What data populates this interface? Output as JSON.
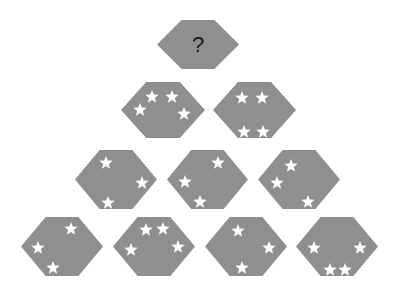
{
  "puzzle": {
    "type": "star-hexagon pyramid",
    "hex_color": "#8f8f8f",
    "star_color": "#ffffff",
    "background": "#ffffff",
    "question_label": "?",
    "hexagons": [
      {
        "row": 1,
        "col": 1,
        "x": 157,
        "y": 20,
        "w": 82,
        "h": 49,
        "label": "?",
        "stars": []
      },
      {
        "row": 2,
        "col": 1,
        "x": 121,
        "y": 82,
        "w": 84,
        "h": 56,
        "stars": [
          [
            31,
            15
          ],
          [
            51,
            15
          ],
          [
            19,
            28
          ],
          [
            63,
            32
          ]
        ]
      },
      {
        "row": 2,
        "col": 2,
        "x": 213,
        "y": 82,
        "w": 83,
        "h": 56,
        "stars": [
          [
            29,
            16
          ],
          [
            49,
            16
          ],
          [
            31,
            50
          ],
          [
            50,
            50
          ]
        ]
      },
      {
        "row": 3,
        "col": 1,
        "x": 75,
        "y": 150,
        "w": 82,
        "h": 59,
        "stars": [
          [
            31,
            13
          ],
          [
            67,
            33
          ],
          [
            33,
            53
          ]
        ]
      },
      {
        "row": 3,
        "col": 2,
        "x": 167,
        "y": 150,
        "w": 81,
        "h": 59,
        "stars": [
          [
            51,
            13
          ],
          [
            18,
            32
          ],
          [
            33,
            52
          ]
        ]
      },
      {
        "row": 3,
        "col": 3,
        "x": 258,
        "y": 150,
        "w": 82,
        "h": 59,
        "stars": [
          [
            33,
            16
          ],
          [
            19,
            33
          ],
          [
            50,
            52
          ]
        ]
      },
      {
        "row": 4,
        "col": 1,
        "x": 21,
        "y": 217,
        "w": 82,
        "h": 59,
        "stars": [
          [
            50,
            12
          ],
          [
            17,
            31
          ],
          [
            32,
            51
          ]
        ]
      },
      {
        "row": 4,
        "col": 2,
        "x": 113,
        "y": 217,
        "w": 82,
        "h": 59,
        "stars": [
          [
            33,
            13
          ],
          [
            50,
            12
          ],
          [
            18,
            33
          ],
          [
            65,
            30
          ]
        ]
      },
      {
        "row": 4,
        "col": 3,
        "x": 205,
        "y": 217,
        "w": 82,
        "h": 59,
        "stars": [
          [
            33,
            14
          ],
          [
            64,
            31
          ],
          [
            37,
            51
          ]
        ]
      },
      {
        "row": 4,
        "col": 4,
        "x": 296,
        "y": 217,
        "w": 82,
        "h": 59,
        "stars": [
          [
            18,
            31
          ],
          [
            64,
            31
          ],
          [
            34,
            53
          ],
          [
            49,
            53
          ]
        ]
      }
    ]
  }
}
